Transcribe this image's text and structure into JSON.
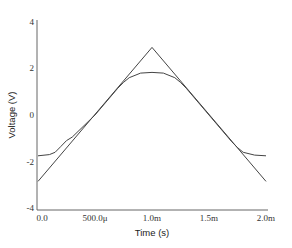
{
  "chart_data": {
    "type": "line",
    "title": "",
    "xlabel": "Time (s)",
    "ylabel": "Voltage (V)",
    "xlim": [
      0,
      0.002
    ],
    "ylim": [
      -4.2,
      4
    ],
    "grid": false,
    "legend": null,
    "x_ticks": [
      {
        "value": 0,
        "label": "0.0"
      },
      {
        "value": 0.0005,
        "label": "500.0μ"
      },
      {
        "value": 0.001,
        "label": "1.0m"
      },
      {
        "value": 0.0015,
        "label": "1.5m"
      },
      {
        "value": 0.002,
        "label": "2.0m"
      }
    ],
    "y_ticks": [
      {
        "value": 4,
        "label": "4"
      },
      {
        "value": 2,
        "label": "2"
      },
      {
        "value": 0,
        "label": "0"
      },
      {
        "value": -2,
        "label": "-2"
      },
      {
        "value": -4,
        "label": "-4"
      }
    ],
    "series": [
      {
        "name": "triangle input",
        "color": "#444444",
        "x": [
          0,
          0.001,
          0.002
        ],
        "y": [
          -2.85,
          2.9,
          -2.85
        ]
      },
      {
        "name": "clipped output",
        "color": "#444444",
        "x": [
          0,
          0.0001,
          0.00015,
          0.0002,
          0.00025,
          0.0003,
          0.0005,
          0.0007,
          0.00075,
          0.0008,
          0.0009,
          0.001,
          0.0011,
          0.0012,
          0.00125,
          0.0013,
          0.0015,
          0.0017,
          0.00175,
          0.0018,
          0.0019,
          0.002
        ],
        "y": [
          -1.75,
          -1.7,
          -1.6,
          -1.35,
          -1.1,
          -0.95,
          0.0,
          1.15,
          1.4,
          1.6,
          1.8,
          1.83,
          1.8,
          1.6,
          1.4,
          1.15,
          0.0,
          -1.15,
          -1.4,
          -1.6,
          -1.72,
          -1.75
        ]
      }
    ]
  }
}
